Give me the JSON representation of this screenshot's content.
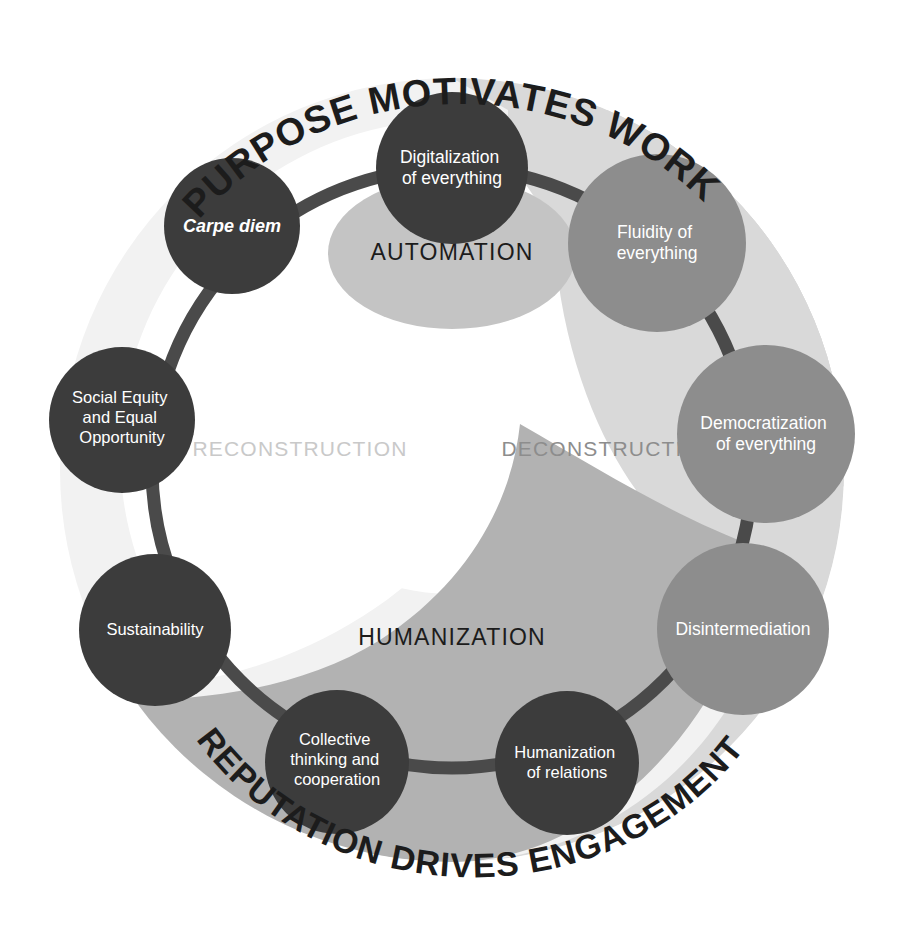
{
  "diagram": {
    "title_top": "PURPOSE MOTIVATES WORK",
    "title_bottom": "REPUTATION DRIVES ENGAGEMENT",
    "colors": {
      "background": "#ffffff",
      "node_dark": "#3c3c3c",
      "node_medium": "#8d8d8d",
      "ring_connector": "#4a4a4a",
      "zone_outer_disc": "#f1f1f1",
      "zone_deconstruction": "#d9d9d9",
      "zone_humanization": "#b2b2b2",
      "zone_automation": "#c4c4c4",
      "label_dark": "#1c1c1c",
      "label_light": "#c9c9c9",
      "node_text": "#ffffff"
    },
    "zones": [
      {
        "id": "automation",
        "label": "AUTOMATION",
        "text_color": "#1c1c1c",
        "fill": "#c4c4c4"
      },
      {
        "id": "reconstruction",
        "label": "RECONSTRUCTION",
        "text_color": "#c9c9c9",
        "fill": "#ffffff"
      },
      {
        "id": "deconstruction",
        "label": "DECONSTRUCTION",
        "text_color": "#8d8d8d",
        "fill": "#d9d9d9"
      },
      {
        "id": "humanization",
        "label": "HUMANIZATION",
        "text_color": "#1c1c1c",
        "fill": "#b2b2b2"
      }
    ],
    "nodes": [
      {
        "id": "digitalization",
        "lines": [
          "Digitalization",
          "of everything"
        ],
        "style": "dark",
        "italic": false
      },
      {
        "id": "fluidity",
        "lines": [
          "Fluidity of",
          "everything"
        ],
        "style": "medium",
        "italic": false
      },
      {
        "id": "democratization",
        "lines": [
          "Democratization",
          "of everything"
        ],
        "style": "medium",
        "italic": false
      },
      {
        "id": "disintermediation",
        "lines": [
          "Disintermediation"
        ],
        "style": "medium",
        "italic": false
      },
      {
        "id": "humanization-of-relations",
        "lines": [
          "Humanization",
          "of relations"
        ],
        "style": "dark",
        "italic": false
      },
      {
        "id": "collective-thinking",
        "lines": [
          "Collective",
          "thinking and",
          "cooperation"
        ],
        "style": "dark",
        "italic": false
      },
      {
        "id": "sustainability",
        "lines": [
          "Sustainability"
        ],
        "style": "dark",
        "italic": false
      },
      {
        "id": "social-equity",
        "lines": [
          "Social Equity",
          "and Equal",
          "Opportunity"
        ],
        "style": "dark",
        "italic": false
      },
      {
        "id": "carpe-diem",
        "lines": [
          "Carpe diem"
        ],
        "style": "dark",
        "italic": true
      }
    ]
  }
}
